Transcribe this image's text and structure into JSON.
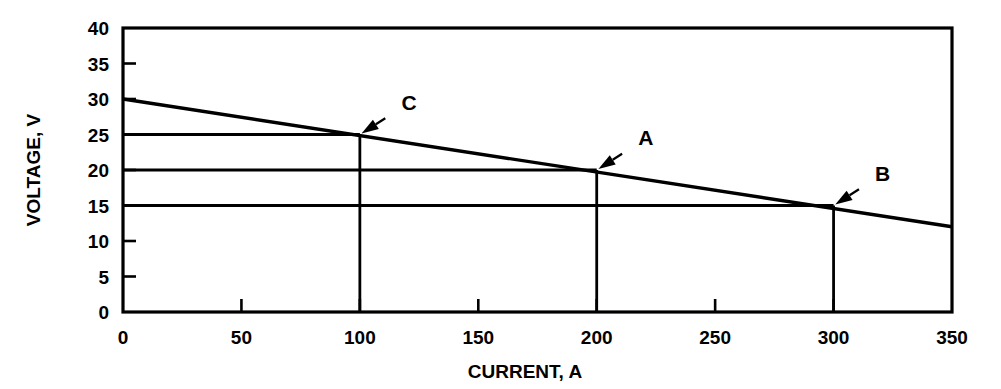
{
  "chart_data": {
    "type": "line",
    "title": "",
    "subtitle": "",
    "xlabel": "CURRENT, A",
    "ylabel": "VOLTAGE, V",
    "xlim": [
      0,
      350
    ],
    "ylim": [
      0,
      40
    ],
    "xticks": [
      0,
      50,
      100,
      150,
      200,
      250,
      300,
      350
    ],
    "xtick_labels": [
      "0",
      "50",
      "100",
      "150",
      "200",
      "250",
      "300",
      "350"
    ],
    "yticks": [
      0,
      5,
      10,
      15,
      20,
      25,
      30,
      35,
      40
    ],
    "ytick_labels": [
      "0",
      "5",
      "10",
      "15",
      "20",
      "25",
      "30",
      "35",
      "40"
    ],
    "grid": false,
    "legend": null,
    "series": [
      {
        "name": "volt-ampere characteristic",
        "x": [
          0,
          350
        ],
        "values": [
          30,
          12
        ]
      }
    ],
    "annotations": [
      {
        "label": "C",
        "x": 100,
        "y": 25,
        "label_x": 115,
        "label_y": 28.2
      },
      {
        "label": "A",
        "x": 200,
        "y": 20,
        "label_x": 215,
        "label_y": 23.2
      },
      {
        "label": "B",
        "x": 300,
        "y": 15,
        "label_x": 315,
        "label_y": 18.2
      }
    ],
    "reference_lines": [
      {
        "from_axis": "y",
        "x": 100,
        "y": 25
      },
      {
        "from_axis": "y",
        "x": 200,
        "y": 20
      },
      {
        "from_axis": "y",
        "x": 300,
        "y": 15
      }
    ],
    "colors": {
      "line": "#000000",
      "axis": "#000000",
      "background": "#ffffff"
    }
  }
}
